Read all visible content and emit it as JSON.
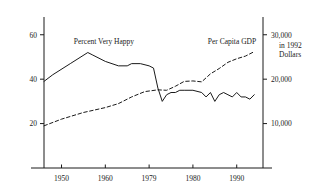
{
  "chart_data": {
    "type": "line",
    "title": "",
    "subtitle": "",
    "xlabel": "",
    "ylabel": "",
    "grid": false,
    "legend_position": "inline-annotation",
    "xlim": [
      1946,
      1996
    ],
    "x_ticks": [
      "1950",
      "1960",
      "1979",
      "1980",
      "1990"
    ],
    "x_tick_values": [
      1950,
      1960,
      1970,
      1980,
      1990
    ],
    "left_axis": {
      "label": "Percent Very Happy",
      "ticks": [
        "20",
        "40",
        "60"
      ],
      "tick_values": [
        20,
        40,
        60
      ],
      "ylim": [
        0,
        68
      ]
    },
    "right_axis": {
      "label": "Per Capita GDP",
      "caption_line1": "in 1992",
      "caption_line2": "Dollars",
      "ticks": [
        "10,000",
        "20,000",
        "30,000"
      ],
      "tick_values": [
        10000,
        20000,
        30000
      ],
      "ylim": [
        0,
        34000
      ]
    },
    "series": [
      {
        "name": "Percent Very Happy",
        "axis": "left",
        "style": "solid",
        "x": [
          1946,
          1948,
          1952,
          1956,
          1957,
          1960,
          1963,
          1965,
          1966,
          1968,
          1970,
          1971,
          1972,
          1973,
          1974,
          1975,
          1976,
          1977,
          1978,
          1980,
          1982,
          1983,
          1984,
          1985,
          1986,
          1987,
          1988,
          1989,
          1990,
          1991,
          1992,
          1993,
          1994
        ],
        "values": [
          39,
          42,
          47,
          52,
          51,
          48,
          46,
          46,
          47,
          47,
          46,
          45,
          36,
          30,
          33,
          34,
          34,
          35,
          35,
          35,
          34,
          32,
          34,
          30,
          33,
          34,
          33,
          32,
          34,
          32,
          32,
          31,
          33
        ]
      },
      {
        "name": "Per Capita GDP",
        "axis": "right",
        "style": "dashed",
        "x": [
          1946,
          1950,
          1955,
          1960,
          1963,
          1966,
          1969,
          1972,
          1974,
          1976,
          1978,
          1980,
          1982,
          1984,
          1986,
          1988,
          1990,
          1992,
          1994
        ],
        "values": [
          9500,
          11000,
          12500,
          13600,
          14500,
          16000,
          17200,
          17600,
          17500,
          18400,
          19500,
          19600,
          19400,
          21200,
          22400,
          23800,
          24600,
          25200,
          26200
        ]
      }
    ]
  }
}
